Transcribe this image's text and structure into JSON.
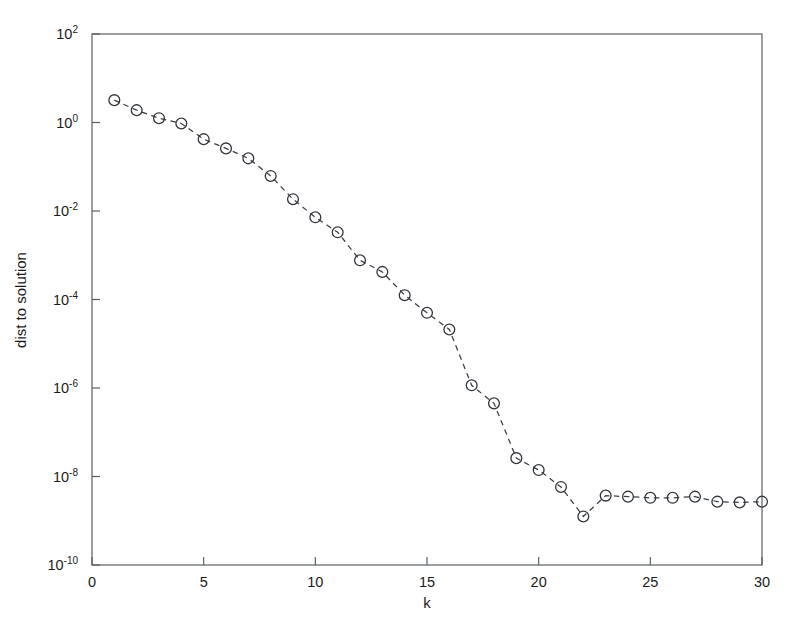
{
  "chart_data": {
    "type": "line",
    "title": "",
    "xlabel": "k",
    "ylabel": "dist to solution",
    "xlim": [
      0,
      30
    ],
    "ylim": [
      1e-10,
      100
    ],
    "yscale": "log",
    "xscale": "linear",
    "grid": false,
    "legend": null,
    "marker": "circle-open",
    "linestyle": "dashed",
    "line_color": "#3a3f45",
    "xticks": [
      0,
      5,
      10,
      15,
      20,
      25,
      30
    ],
    "xtick_labels": [
      "0",
      "5",
      "10",
      "15",
      "20",
      "25",
      "30"
    ],
    "yticks": [
      100,
      1,
      0.01,
      0.0001,
      1e-06,
      1e-08,
      1e-10
    ],
    "ytick_labels": [
      "10^2",
      "10^0",
      "10^-2",
      "10^-4",
      "10^-6",
      "10^-8",
      "10^-10"
    ],
    "ytick_mantissa": [
      "10",
      "10",
      "10",
      "10",
      "10",
      "10",
      "10"
    ],
    "ytick_exponents": [
      "2",
      "0",
      "-2",
      "-4",
      "-6",
      "-8",
      "-10"
    ],
    "x": [
      1,
      2,
      3,
      4,
      5,
      6,
      7,
      8,
      9,
      10,
      11,
      12,
      13,
      14,
      15,
      16,
      17,
      18,
      19,
      20,
      21,
      22,
      23,
      24,
      25,
      26,
      27,
      28,
      29,
      30
    ],
    "values": [
      3.2,
      1.9,
      1.25,
      0.95,
      0.42,
      0.26,
      0.155,
      0.062,
      0.0185,
      0.0072,
      0.0033,
      0.00077,
      0.00042,
      0.000125,
      5e-05,
      2.1e-05,
      1.15e-06,
      4.5e-07,
      2.6e-08,
      1.4e-08,
      5.8e-09,
      1.25e-09,
      3.7e-09,
      3.5e-09,
      3.3e-09,
      3.3e-09,
      3.5e-09,
      2.7e-09,
      2.6e-09,
      2.7e-09
    ]
  },
  "figure": {
    "background": "#ffffff",
    "frame_color": "#555b5e",
    "marker_color": "#33373d"
  }
}
